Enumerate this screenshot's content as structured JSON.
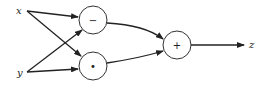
{
  "diagram": {
    "type": "computation-graph",
    "inputs": [
      {
        "id": "x",
        "label": "x"
      },
      {
        "id": "y",
        "label": "y"
      }
    ],
    "nodes": [
      {
        "id": "sub",
        "label": "−",
        "operation": "subtract"
      },
      {
        "id": "mul",
        "label": "•",
        "operation": "multiply"
      },
      {
        "id": "add",
        "label": "+",
        "operation": "add"
      }
    ],
    "output": {
      "id": "z",
      "label": "z"
    },
    "edges": [
      {
        "from": "x",
        "to": "sub"
      },
      {
        "from": "x",
        "to": "mul"
      },
      {
        "from": "y",
        "to": "sub"
      },
      {
        "from": "y",
        "to": "mul"
      },
      {
        "from": "sub",
        "to": "add"
      },
      {
        "from": "mul",
        "to": "add"
      },
      {
        "from": "add",
        "to": "z"
      }
    ]
  }
}
